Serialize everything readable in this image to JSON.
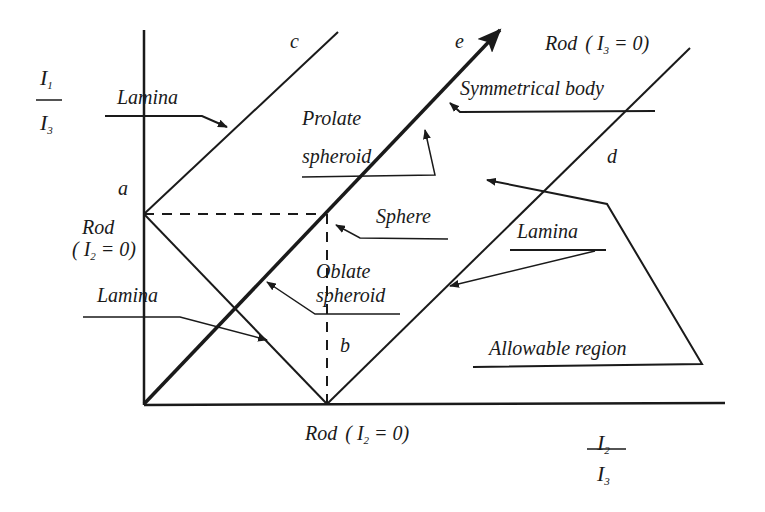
{
  "diagram": {
    "axes": {
      "y_label": {
        "numerator": "I",
        "numerator_sub": "1",
        "denominator": "I",
        "denominator_sub": "3"
      },
      "x_label": {
        "numerator": "I",
        "numerator_sub": "2",
        "denominator": "I",
        "denominator_sub": "3"
      }
    },
    "point_labels": {
      "a": "a",
      "b": "b",
      "c": "c",
      "d": "d",
      "e": "e"
    },
    "annotations": {
      "lamina_top": "Lamina",
      "lamina_left": "Lamina",
      "lamina_right": "Lamina",
      "prolate_line1": "Prolate",
      "prolate_line2": "spheroid",
      "oblate_line1": "Oblate",
      "oblate_line2": "spheroid",
      "sphere": "Sphere",
      "symmetrical_body": "Symmetrical body",
      "allowable_region": "Allowable region",
      "rod_top": "Rod",
      "rod_top_eq": "( I",
      "rod_top_sub": "3",
      "rod_top_rest": " = 0)",
      "rod_left_line1": "Rod",
      "rod_left_eq": "( I",
      "rod_left_sub": "2",
      "rod_left_rest": " = 0)",
      "rod_bottom": "Rod",
      "rod_bottom_eq": "( I",
      "rod_bottom_sub": "2",
      "rod_bottom_rest": " = 0)"
    },
    "stroke_color": "#1a1a1a",
    "background": "#ffffff"
  }
}
